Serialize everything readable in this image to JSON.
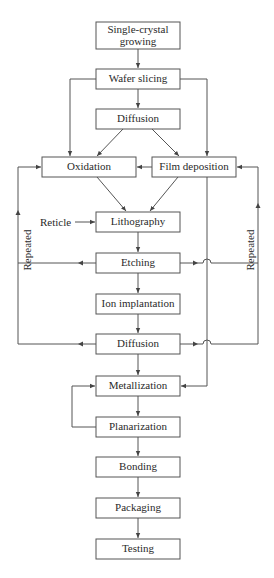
{
  "diagram": {
    "type": "flowchart",
    "nodes": {
      "single_crystal_line1": "Single-crystal",
      "single_crystal_line2": "growing",
      "wafer_slicing": "Wafer slicing",
      "diffusion_1": "Diffusion",
      "oxidation": "Oxidation",
      "film_deposition": "Film deposition",
      "lithography": "Lithography",
      "etching": "Etching",
      "ion_implantation": "Ion implantation",
      "diffusion_2": "Diffusion",
      "metallization": "Metallization",
      "planarization": "Planarization",
      "bonding": "Bonding",
      "packaging": "Packaging",
      "testing": "Testing"
    },
    "inputs": {
      "reticle": "Reticle"
    },
    "loop_labels": {
      "left": "Repeated",
      "right": "Repeated"
    },
    "edges": [
      [
        "Single-crystal growing",
        "Wafer slicing"
      ],
      [
        "Wafer slicing",
        "Diffusion"
      ],
      [
        "Wafer slicing",
        "Oxidation"
      ],
      [
        "Wafer slicing",
        "Film deposition"
      ],
      [
        "Diffusion",
        "Oxidation"
      ],
      [
        "Diffusion",
        "Film deposition"
      ],
      [
        "Film deposition",
        "Oxidation"
      ],
      [
        "Oxidation",
        "Lithography"
      ],
      [
        "Film deposition",
        "Lithography"
      ],
      [
        "Reticle",
        "Lithography"
      ],
      [
        "Lithography",
        "Etching"
      ],
      [
        "Etching",
        "Ion implantation"
      ],
      [
        "Ion implantation",
        "Diffusion"
      ],
      [
        "Etching",
        "Oxidation (Repeated)"
      ],
      [
        "Etching",
        "Film deposition (Repeated)"
      ],
      [
        "Diffusion",
        "Oxidation (Repeated)"
      ],
      [
        "Diffusion",
        "Film deposition (Repeated)"
      ],
      [
        "Diffusion",
        "Metallization"
      ],
      [
        "Film deposition",
        "Metallization"
      ],
      [
        "Metallization",
        "Planarization"
      ],
      [
        "Planarization",
        "Metallization"
      ],
      [
        "Planarization",
        "Bonding"
      ],
      [
        "Bonding",
        "Packaging"
      ],
      [
        "Packaging",
        "Testing"
      ]
    ],
    "colors": {
      "stroke": "#555555",
      "text": "#2a2a2a",
      "background": "#ffffff"
    }
  }
}
